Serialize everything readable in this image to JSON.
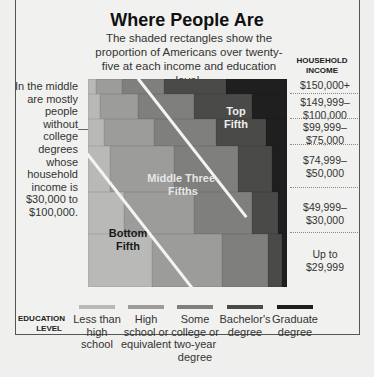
{
  "title": "Where People Are",
  "subtitle": "The shaded rectangles show the proportion of Americans over twenty-five at each income and education level.",
  "income_axis_title": "HOUSEHOLD INCOME",
  "education_axis_title": "EDUCATION LEVEL",
  "left_annotation": "In the middle are mostly people without college degrees whose household income is $30,000 to $100,000.",
  "region_labels": {
    "top": "Top Fifth",
    "middle": "Middle Three-Fifths",
    "bottom": "Bottom Fifth"
  },
  "income_levels": [
    "$150,000+",
    "$149,999–$100,000",
    "$99,999–$75,000",
    "$74,999–$50,000",
    "$49,999–$30,000",
    "Up to $29,999"
  ],
  "education_levels": [
    {
      "label": "Less than high school",
      "color": "#b9b9b7"
    },
    {
      "label": "High school or equivalent",
      "color": "#9c9c9a"
    },
    {
      "label": "Some college or two-year degree",
      "color": "#7f7f7d"
    },
    {
      "label": "Bachelor's degree",
      "color": "#4a4a48"
    },
    {
      "label": "Graduate degree",
      "color": "#1f1f1f"
    }
  ],
  "chart_data": {
    "type": "heatmap",
    "title": "Where People Are",
    "subtitle": "The shaded rectangles show the proportion of Americans over twenty-five at each income and education level.",
    "xlabel": "Education Level",
    "ylabel": "Household Income",
    "rows": [
      "$150,000+",
      "$149,999–$100,000",
      "$99,999–$75,000",
      "$74,999–$50,000",
      "$49,999–$30,000",
      "Up to $29,999"
    ],
    "columns": [
      "Less than high school",
      "High school or equivalent",
      "Some college or two-year degree",
      "Bachelor's degree",
      "Graduate degree"
    ],
    "row_height_share_pct": [
      7,
      12,
      13,
      22,
      20,
      26
    ],
    "cell_width_share_pct_within_row": [
      [
        4,
        13,
        21,
        31,
        31
      ],
      [
        6,
        19,
        28,
        29,
        18
      ],
      [
        8,
        25,
        31,
        25,
        11
      ],
      [
        11,
        32,
        32,
        17,
        8
      ],
      [
        18,
        35,
        29,
        13,
        5
      ],
      [
        32,
        35,
        23,
        7,
        3
      ]
    ],
    "annotations": [
      "Top Fifth",
      "Middle Three-Fifths",
      "Bottom Fifth"
    ],
    "legend_position": "bottom"
  }
}
